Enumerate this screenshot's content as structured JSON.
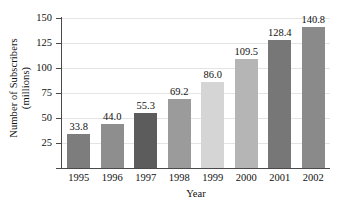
{
  "chart_data": {
    "type": "bar",
    "title": "",
    "xlabel": "Year",
    "ylabel": "Number of Subscribers (millions)",
    "ylabel_line1": "Number of Subscribers",
    "ylabel_line2": "(millions)",
    "categories": [
      "1995",
      "1996",
      "1997",
      "1998",
      "1999",
      "2000",
      "2001",
      "2002"
    ],
    "values": [
      33.8,
      44.0,
      55.3,
      69.2,
      86.0,
      109.5,
      128.4,
      140.8
    ],
    "value_labels": [
      "33.8",
      "44.0",
      "55.3",
      "69.2",
      "86.0",
      "109.5",
      "128.4",
      "140.8"
    ],
    "bar_colors": [
      "#7d7d7d",
      "#8e8e8e",
      "#5c5c5c",
      "#9b9b9b",
      "#d5d5d5",
      "#b5b5b5",
      "#777777",
      "#8a8a8a"
    ],
    "ylim": [
      0,
      150
    ],
    "ytick_values": [
      25,
      50,
      75,
      100,
      125,
      150
    ],
    "ytick_labels": [
      "25",
      "50",
      "75",
      "100",
      "125",
      "150"
    ],
    "xlim_note": "categorical",
    "grid": "horizontal-faint",
    "legend": "none",
    "axis_color": "#4a4a4a",
    "grid_color": "#e4e4e4",
    "text_color": "#111111",
    "background": "#ffffff"
  }
}
